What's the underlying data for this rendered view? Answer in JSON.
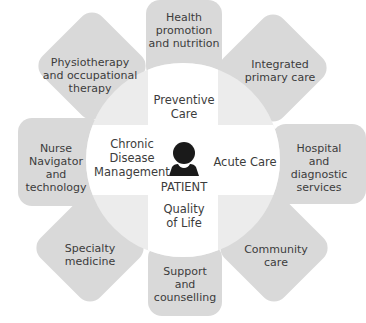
{
  "diagram": {
    "title": "",
    "center": {
      "label": "PATIENT",
      "icon": "person-icon"
    },
    "hub_segments": [
      {
        "id": "top",
        "label": "Preventive\nCare"
      },
      {
        "id": "right",
        "label": "Acute Care"
      },
      {
        "id": "bottom",
        "label": "Quality\nof Life"
      },
      {
        "id": "left",
        "label": "Chronic\nDisease\nManagement"
      }
    ],
    "petals": [
      {
        "id": "top",
        "label": "Health\npromotion\nand nutrition"
      },
      {
        "id": "top-right",
        "label": "Integrated\nprimary care"
      },
      {
        "id": "right",
        "label": "Hospital\nand\ndiagnostic\nservices"
      },
      {
        "id": "bottom-right",
        "label": "Community\ncare"
      },
      {
        "id": "bottom",
        "label": "Support\nand\ncounselling"
      },
      {
        "id": "bottom-left",
        "label": "Specialty\nmedicine"
      },
      {
        "id": "left",
        "label": "Nurse\nNavigator\nand\ntechnology"
      },
      {
        "id": "top-left",
        "label": "Physiotherapy\nand occupational\ntherapy"
      }
    ],
    "colors": {
      "petal_fill": "#d9d9d9",
      "hub_quadrant_fill": "#ececec",
      "hub_cross_fill": "#ffffff",
      "icon_fill": "#1a1a1a",
      "text": "#3c3c3c"
    }
  }
}
